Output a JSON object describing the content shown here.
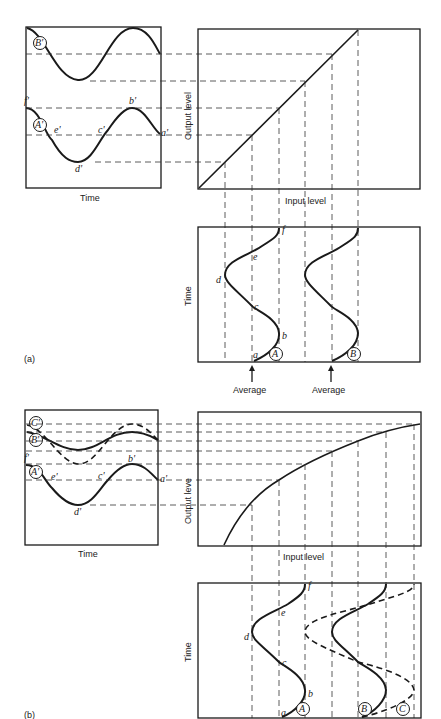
{
  "header": {
    "caption": "Compression transfer function"
  },
  "panel_a": {
    "label": "(a)",
    "waveform": {
      "xlabel": "Time",
      "point_labels": [
        "f'",
        "e'",
        "d'",
        "c'",
        "b'",
        "a'"
      ],
      "wave_labels": [
        "B'",
        "A'"
      ]
    },
    "transfer": {
      "xlabel": "Input level",
      "ylabel": "Output level",
      "type": "linear"
    },
    "input_time": {
      "ylabel": "Time",
      "point_labels": [
        "a",
        "b",
        "c",
        "d",
        "e",
        "f"
      ],
      "wave_labels": [
        "A",
        "B"
      ],
      "markers": [
        "Average",
        "Average"
      ]
    }
  },
  "panel_b": {
    "label": "(b)",
    "waveform": {
      "xlabel": "Time",
      "point_labels": [
        "f'",
        "e'",
        "d'",
        "c'",
        "b'",
        "a'"
      ],
      "wave_labels": [
        "C'",
        "B'",
        "A'"
      ]
    },
    "transfer": {
      "xlabel": "Input level",
      "ylabel": "Output leve",
      "type": "compressive"
    },
    "input_time": {
      "ylabel": "Time",
      "point_labels": [
        "a",
        "b",
        "c",
        "d",
        "e",
        "f"
      ],
      "wave_labels": [
        "A",
        "B",
        "C"
      ]
    }
  }
}
